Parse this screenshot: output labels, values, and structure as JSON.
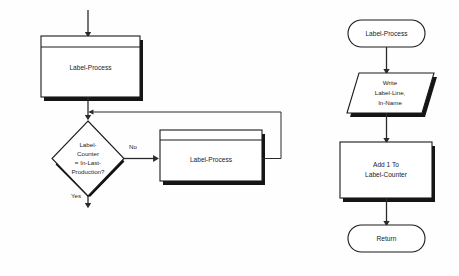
{
  "diagram": {
    "background_color": "#fefefe",
    "line_color": "#2a2a2a",
    "shape_fill": "#ffffff",
    "shape_stroke": "#1b1b1b",
    "shadow_color": "#151515"
  },
  "left_flow": {
    "name": "main-loop",
    "entry_arrow": "entry-arrow",
    "nodes": [
      {
        "id": "left-predefined-1",
        "type": "predefined-process",
        "label": "Label-Process"
      },
      {
        "id": "left-decision",
        "type": "decision",
        "label_lines": [
          "Label-",
          "Counter",
          "= In-Last-",
          "Production?"
        ]
      },
      {
        "id": "left-predefined-2",
        "type": "predefined-process",
        "label": "Label-Process"
      }
    ],
    "edge_labels": {
      "no": "No",
      "yes": "Yes"
    }
  },
  "right_flow": {
    "name": "label-process-subroutine",
    "nodes": [
      {
        "id": "right-terminator-start",
        "type": "terminator",
        "label": "Label-Process"
      },
      {
        "id": "right-io",
        "type": "input-output",
        "label_lines": [
          "Write",
          "Label-Line,",
          "In-Name"
        ]
      },
      {
        "id": "right-process",
        "type": "process",
        "label_lines": [
          "Add 1 To",
          "Label-Counter"
        ]
      },
      {
        "id": "right-terminator-end",
        "type": "terminator",
        "label": "Return"
      }
    ]
  }
}
